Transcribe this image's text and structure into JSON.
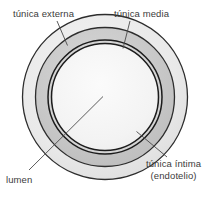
{
  "diagram": {
    "background_color": "#ffffff",
    "labels": {
      "tunica_externa": "túnica externa",
      "tunica_media": "túnica media",
      "lumen": "lumen",
      "tunica_intima": "túnica íntima",
      "tunica_intima_sub": "(endotelio)"
    },
    "layers": [
      {
        "name": "tunica-externa",
        "label": "túnica externa",
        "fill": "#e8e8e8",
        "stroke": "#2b2b2b",
        "outer_radius": 83,
        "inner_radius": 70
      },
      {
        "name": "tunica-media",
        "label": "túnica media",
        "fill": "#c9c9c9",
        "stroke": "#2b2b2b",
        "outer_radius": 70,
        "inner_radius": 57
      },
      {
        "name": "tunica-intima",
        "label": "túnica íntima (endotelio)",
        "fill": "#d8d8d8",
        "stroke": "#1f1f1f",
        "outer_radius": 57,
        "inner_radius": 54
      },
      {
        "name": "lumen",
        "label": "lumen",
        "fill": "#f4f4f4",
        "stroke": "#1f1f1f",
        "outer_radius": 54,
        "inner_radius": 0
      }
    ],
    "center": {
      "x": 105,
      "y": 97
    },
    "leader_lines": [
      {
        "name": "leader-tunica-externa",
        "x1": 57,
        "y1": 21,
        "x2": 67,
        "y2": 45
      },
      {
        "name": "leader-tunica-media",
        "x1": 130,
        "y1": 21,
        "x2": 123,
        "y2": 48
      },
      {
        "name": "leader-lumen",
        "x1": 30,
        "y1": 170,
        "x2": 103,
        "y2": 96
      },
      {
        "name": "leader-tunica-intima",
        "x1": 166,
        "y1": 157,
        "x2": 137,
        "y2": 132
      }
    ]
  }
}
